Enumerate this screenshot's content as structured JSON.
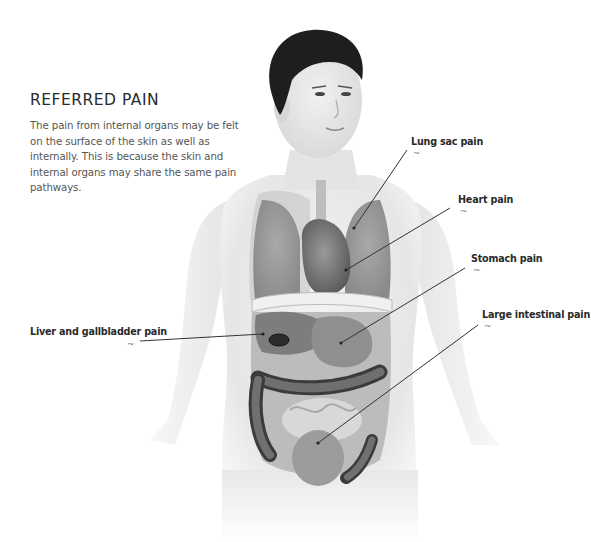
{
  "intro": {
    "title": "REFERRED PAIN",
    "body": "The pain from internal organs may be felt on the surface of the skin as well as internally. This is because the skin and internal organs may share the same pain pathways."
  },
  "labels": [
    {
      "id": "lung",
      "text": "Lung sac pain",
      "marker": "~"
    },
    {
      "id": "heart",
      "text": "Heart pain",
      "marker": "~"
    },
    {
      "id": "stomach",
      "text": "Stomach pain",
      "marker": "~"
    },
    {
      "id": "liver",
      "text": "Liver and gallbladder pain",
      "marker": "~"
    },
    {
      "id": "intestine",
      "text": "Large intestinal pain",
      "marker": "~"
    }
  ],
  "colors": {
    "text_heading": "#2b2b2b",
    "text_body": "#555555",
    "leader_line": "#333333",
    "skin": "#e9e9e9",
    "organ_dark": "#6e6e6e",
    "hair": "#1e1e1e"
  }
}
